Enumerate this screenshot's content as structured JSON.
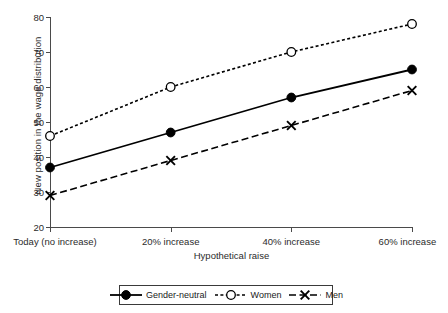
{
  "chart_data": {
    "type": "line",
    "title": "",
    "xlabel": "Hypothetical raise",
    "ylabel": "New position in the wage distribution",
    "categories": [
      "Today (no increase)",
      "20% increase",
      "40% increase",
      "60% increase"
    ],
    "ylim": [
      20,
      80
    ],
    "yticks": [
      20,
      30,
      40,
      50,
      60,
      70,
      80
    ],
    "grid": false,
    "legend_position": "bottom-center",
    "series": [
      {
        "name": "Gender-neutral",
        "values": [
          37,
          47,
          57,
          65
        ],
        "marker": "filled-circle",
        "line_style": "solid",
        "color": "#000000"
      },
      {
        "name": "Women",
        "values": [
          46,
          60,
          70,
          78
        ],
        "marker": "open-circle",
        "line_style": "dotted",
        "color": "#000000"
      },
      {
        "name": "Men",
        "values": [
          29,
          39,
          49,
          59
        ],
        "marker": "x",
        "line_style": "dashed",
        "color": "#000000"
      }
    ]
  },
  "legend": {
    "items": [
      {
        "label": "Gender-neutral"
      },
      {
        "label": "Women"
      },
      {
        "label": "Men"
      }
    ]
  }
}
